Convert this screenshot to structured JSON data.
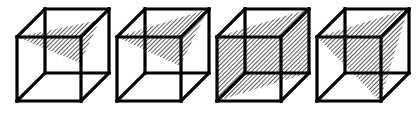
{
  "figure": {
    "colors": {
      "edge": "#000000",
      "hatch": "#000000",
      "background": "#ffffff"
    },
    "cube_geometry": {
      "front_face": {
        "x": 17,
        "y": 37,
        "w": 64,
        "h": 64
      },
      "depth_offset": {
        "dx": 28,
        "dy": -28
      },
      "spacing": 100
    },
    "cubes": [
      {
        "id": 1,
        "offset_x": 0,
        "section_shape": "triangle",
        "section_points": [
          [
            17,
            37
          ],
          [
            100,
            20
          ],
          [
            80,
            63
          ]
        ]
      },
      {
        "id": 2,
        "offset_x": 100,
        "section_shape": "triangle",
        "section_points": [
          [
            17,
            37
          ],
          [
            108,
            9
          ],
          [
            80,
            66
          ]
        ]
      },
      {
        "id": 3,
        "offset_x": 200,
        "section_shape": "rectangle",
        "section_points": [
          [
            17,
            37
          ],
          [
            108,
            9
          ],
          [
            108,
            73
          ],
          [
            17,
            101
          ]
        ]
      },
      {
        "id": 4,
        "offset_x": 300,
        "section_shape": "triangle",
        "section_points": [
          [
            17,
            37
          ],
          [
            108,
            9
          ],
          [
            80,
            101
          ]
        ]
      }
    ]
  }
}
